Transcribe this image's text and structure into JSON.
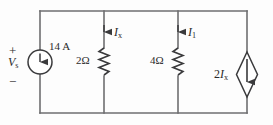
{
  "figure": {
    "colors": {
      "wire": "#6e6e70",
      "component": "#3a3a3c",
      "label": "#2b2b2b",
      "background": "#fdfdfd"
    }
  },
  "source_independent": {
    "name": "independent-current-source",
    "value_label": "14 A",
    "voltage_label_var": "V",
    "voltage_label_sub": "s",
    "polarity_plus": "+",
    "polarity_minus": "−",
    "arrow_direction": "up",
    "shape": "circle"
  },
  "resistor_1": {
    "name": "resistor-2-ohm",
    "value_label": "2Ω",
    "current_var": "I",
    "current_sub": "x",
    "current_arrow_direction": "down"
  },
  "resistor_2": {
    "name": "resistor-4-ohm",
    "value_label": "4Ω",
    "current_var": "I",
    "current_sub": "1",
    "current_arrow_direction": "down"
  },
  "source_dependent": {
    "name": "dependent-current-source",
    "value_prefix": "2",
    "value_var": "I",
    "value_sub": "x",
    "arrow_direction": "down",
    "shape": "diamond"
  },
  "circuit_data": {
    "type": "schematic",
    "nodes": [
      "top-rail",
      "bottom-rail"
    ],
    "branches": [
      {
        "element": "current-source",
        "label": "14 A",
        "position_x": 40
      },
      {
        "element": "resistor",
        "label": "2Ω",
        "current": "Ix",
        "position_x": 104
      },
      {
        "element": "resistor",
        "label": "4Ω",
        "current": "I1",
        "position_x": 178
      },
      {
        "element": "dependent-current-source",
        "label": "2Ix",
        "position_x": 247
      }
    ],
    "rails": {
      "top_y": 11,
      "bottom_y": 113
    }
  }
}
